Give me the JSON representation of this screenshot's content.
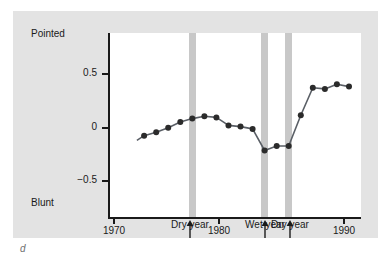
{
  "figure": {
    "mark": "d",
    "panel_background": "#e3e3e3",
    "plot_background": "#ffffff",
    "axis_color": "#1a1a1a",
    "band_color": "#c8c8c8",
    "line_color": "#5a5f66",
    "marker_color": "#2b2b2b"
  },
  "chart_data": {
    "type": "line",
    "title": "",
    "xlabel": "",
    "ylabel": "",
    "axis_top_label": "Pointed",
    "axis_bottom_label": "Blunt",
    "xlim": [
      1970,
      1991
    ],
    "ylim": [
      -0.85,
      0.78
    ],
    "grid": false,
    "legend": null,
    "y_ticks": [
      0.5,
      0,
      -0.5
    ],
    "y_tick_labels": [
      "0.5",
      "0",
      "−0.5"
    ],
    "x_ticks": [
      1970,
      1980,
      1990
    ],
    "x_tick_labels": [
      "1970",
      "1980",
      "1990"
    ],
    "series": [
      {
        "name": "Beak shape index",
        "x": [
          1973,
          1974,
          1975,
          1976,
          1977,
          1978,
          1979,
          1980,
          1981,
          1982,
          1983,
          1984,
          1985,
          1986,
          1987,
          1988,
          1989,
          1990
        ],
        "values": [
          -0.12,
          -0.09,
          -0.05,
          0.0,
          0.03,
          0.05,
          0.04,
          -0.03,
          -0.04,
          -0.06,
          -0.25,
          -0.21,
          -0.21,
          0.06,
          0.3,
          0.29,
          0.33,
          0.31
        ]
      }
    ],
    "line_start_x": 1972.4,
    "line_start_y": -0.16,
    "highlight_bands": [
      {
        "year": 1977,
        "label": "Dry year",
        "type": "dry"
      },
      {
        "year": 1983,
        "label": "Wet year",
        "type": "wet"
      },
      {
        "year": 1985,
        "label": "Dry year",
        "type": "dry"
      }
    ],
    "annotations": [
      {
        "label": "Dry year",
        "year": 1977
      },
      {
        "label": "Wet year",
        "year": 1983
      },
      {
        "label": "Dry year",
        "year": 1985
      }
    ]
  }
}
